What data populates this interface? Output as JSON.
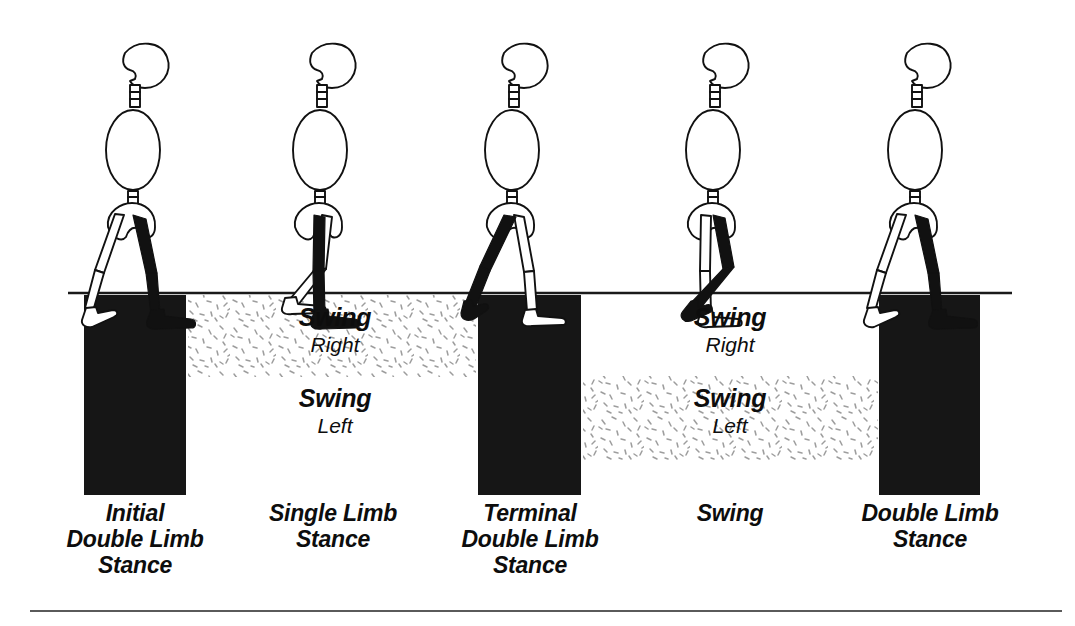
{
  "figure": {
    "colors": {
      "ink": "#111111",
      "block": "#161616",
      "background": "#ffffff",
      "rule": "#5a5a5a",
      "stipple": "#9a9a9a"
    }
  },
  "walkers": [
    {
      "id": "walker-1",
      "pose": "initial-contact-heel-strike",
      "black_limb": "right-trailing-vertical"
    },
    {
      "id": "walker-2",
      "pose": "midstance-single-limb-support",
      "black_limb": "right-vertical"
    },
    {
      "id": "walker-3",
      "pose": "terminal-stance-toe-off",
      "black_limb": "right-behind"
    },
    {
      "id": "walker-4",
      "pose": "mid-swing-knee-flexed",
      "black_limb": "right-swinging"
    },
    {
      "id": "walker-5",
      "pose": "initial-contact-heel-strike",
      "black_limb": "right-trailing-vertical"
    }
  ],
  "timeline": {
    "ground_line": true,
    "blocks": [
      {
        "name": "initial-double-limb-stance",
        "filled": true
      },
      {
        "name": "single-limb-stance",
        "filled": false
      },
      {
        "name": "terminal-double-limb-stance",
        "filled": true
      },
      {
        "name": "swing",
        "filled": false
      },
      {
        "name": "double-limb-stance",
        "filled": true
      }
    ],
    "swing_bands": [
      {
        "name": "swing-right",
        "row": "top",
        "main": "Swing",
        "side": "Right",
        "stippled": true
      },
      {
        "name": "swing-left",
        "row": "bottom",
        "main": "Swing",
        "side": "Left",
        "stippled": false
      },
      {
        "name": "swing-right",
        "row": "top",
        "main": "Swing",
        "side": "Right",
        "stippled": false
      },
      {
        "name": "swing-left",
        "row": "bottom",
        "main": "Swing",
        "side": "Left",
        "stippled": true
      }
    ]
  },
  "captions": [
    {
      "id": "caption-1",
      "text": "Initial\nDouble Limb\nStance"
    },
    {
      "id": "caption-2",
      "text": "Single Limb\nStance"
    },
    {
      "id": "caption-3",
      "text": "Terminal\nDouble Limb\nStance"
    },
    {
      "id": "caption-4",
      "text": "Swing"
    },
    {
      "id": "caption-5",
      "text": "Double Limb\nStance"
    }
  ],
  "swing_labels": {
    "top_left": {
      "main": "Swing",
      "side": "Right"
    },
    "mid_left": {
      "main": "Swing",
      "side": "Left"
    },
    "top_right": {
      "main": "Swing",
      "side": "Right"
    },
    "mid_right": {
      "main": "Swing",
      "side": "Left"
    }
  }
}
